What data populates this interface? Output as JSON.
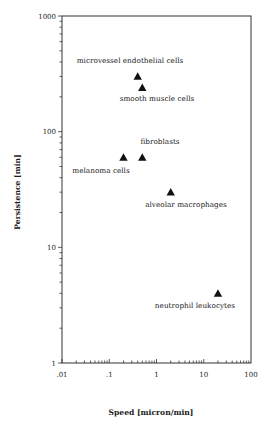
{
  "chart_data": {
    "type": "scatter",
    "title": "",
    "xlabel": "Speed [micron/min]",
    "ylabel": "Persistence [min]",
    "xscale": "log",
    "yscale": "log",
    "xlim": [
      0.01,
      100
    ],
    "ylim": [
      1,
      1000
    ],
    "grid": false,
    "legend": "none",
    "marker": "filled-triangle",
    "x_ticks": [
      ".01",
      ".1",
      "1",
      "10",
      "100"
    ],
    "y_ticks": [
      "1",
      "10",
      "100",
      "1000"
    ],
    "points": [
      {
        "label": "microvessel endothelial cells",
        "x": 0.4,
        "y": 300
      },
      {
        "label": "smooth muscle cells",
        "x": 0.5,
        "y": 240
      },
      {
        "label": "fibroblasts",
        "x": 0.5,
        "y": 60
      },
      {
        "label": "melanoma cells",
        "x": 0.2,
        "y": 60
      },
      {
        "label": "alveolar macrophages",
        "x": 2,
        "y": 30
      },
      {
        "label": "neutrophil leukocytes",
        "x": 20,
        "y": 4
      }
    ]
  },
  "layout": {
    "plot": {
      "left": 62,
      "right": 251,
      "top": 16,
      "bottom": 363
    },
    "label_offsets": [
      {
        "dx": 0,
        "dy": -13,
        "anchor": "middle",
        "cx": 130
      },
      {
        "dx": 0,
        "dy": 13,
        "anchor": "middle",
        "cx": 157
      },
      {
        "dx": 0,
        "dy": -13,
        "anchor": "middle",
        "cx": 160
      },
      {
        "dx": 0,
        "dy": 16,
        "anchor": "middle",
        "cx": 101
      },
      {
        "dx": 0,
        "dy": 15,
        "anchor": "middle",
        "cx": 186
      },
      {
        "dx": 0,
        "dy": 15,
        "anchor": "middle",
        "cx": 195
      }
    ]
  },
  "colors": {
    "axis": "#333333",
    "marker": "#111111",
    "text": "#1a1a1a"
  }
}
